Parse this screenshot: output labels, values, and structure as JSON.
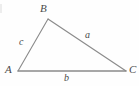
{
  "figure": {
    "type": "geometry-diagram",
    "background_color": "#fefefe",
    "stroke_color": "#8a8a8a",
    "text_color": "#4a4a4a",
    "width": 139,
    "height": 86,
    "vertices": [
      {
        "id": "A",
        "label": "A",
        "x": 18,
        "y": 71,
        "label_x": 5,
        "label_y": 64
      },
      {
        "id": "B",
        "label": "B",
        "x": 48,
        "y": 19,
        "label_x": 40,
        "label_y": 3
      },
      {
        "id": "C",
        "label": "C",
        "x": 126,
        "y": 71,
        "label_x": 129,
        "label_y": 64
      }
    ],
    "sides": [
      {
        "id": "a",
        "label": "a",
        "from": "B",
        "to": "C",
        "label_x": 85,
        "label_y": 30
      },
      {
        "id": "b",
        "label": "b",
        "from": "A",
        "to": "C",
        "label_x": 64,
        "label_y": 73
      },
      {
        "id": "c",
        "label": "c",
        "from": "A",
        "to": "B",
        "label_x": 19,
        "label_y": 37
      }
    ]
  }
}
